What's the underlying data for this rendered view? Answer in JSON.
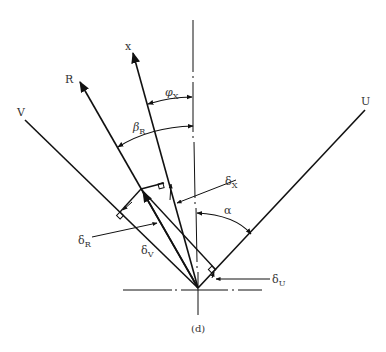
{
  "diagram": {
    "caption": "(d)",
    "axis_labels": {
      "x": "x",
      "R": "R",
      "V": "V",
      "U": "U"
    },
    "angle_labels": {
      "phi": {
        "symbol": "φ",
        "sub": "X"
      },
      "beta": {
        "symbol": "β",
        "sub": "R"
      },
      "alpha": {
        "symbol": "α"
      }
    },
    "deviation_labels": {
      "delta_x": {
        "symbol": "δ",
        "sub": "X"
      },
      "delta_r": {
        "symbol": "δ",
        "sub": "R"
      },
      "delta_v": {
        "symbol": "δ",
        "sub": "V"
      },
      "delta_u": {
        "symbol": "δ",
        "sub": "U"
      }
    },
    "stroke_color": "#111111"
  }
}
